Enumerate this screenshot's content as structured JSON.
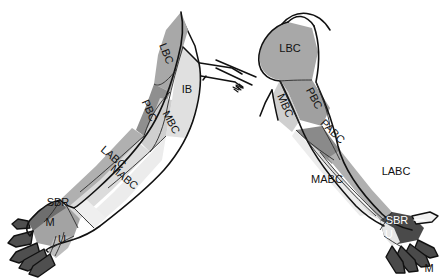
{
  "figure": {
    "views": [
      {
        "name": "anterior-view",
        "side": "left"
      },
      {
        "name": "posterior-view",
        "side": "right"
      }
    ]
  },
  "palette": {
    "background": "#ffffff",
    "outline": "#111111",
    "zone_dark": "#4a4a4a",
    "zone_mid_dark": "#8f8f8f",
    "zone_mid": "#a8a8a8",
    "zone_light_mid": "#c2c2c2",
    "zone_light": "#d9d9d9",
    "zone_pale": "#e8e8e8",
    "label_text": "#111111",
    "label_text_light": "#ffffff"
  },
  "left_arm": {
    "view": "anterior",
    "labels": {
      "lbc": "LBC",
      "ib": "IB",
      "pbc": "PBC",
      "mbc": "MBC",
      "labc": "LABC",
      "mabc": "MABC",
      "sbr": "SBR",
      "m": "M",
      "u": "U"
    }
  },
  "right_arm": {
    "view": "posterior",
    "labels": {
      "lbc": "LBC",
      "pbc": "PBC",
      "mbc": "MBC",
      "pabc": "PABC",
      "labc": "LABC",
      "mabc": "MABC",
      "sbr": "SBR",
      "u": "U",
      "m": "M"
    }
  }
}
